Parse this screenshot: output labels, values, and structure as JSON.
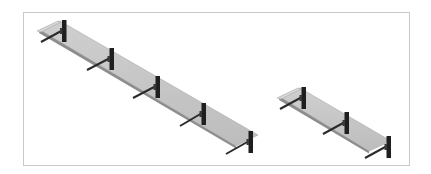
{
  "figure": {
    "frame_color": "#c9c9c9",
    "background": "#ffffff",
    "items": [
      {
        "name": "long-glass-shelf",
        "glass_color": "#c4c4c4",
        "glass_edge_color": "#9a9a9a",
        "bracket_color": "#1f1f1f",
        "bracket_count": 5
      },
      {
        "name": "short-glass-shelf",
        "glass_color": "#c4c4c4",
        "glass_edge_color": "#9a9a9a",
        "bracket_color": "#1f1f1f",
        "bracket_count": 3
      }
    ]
  }
}
